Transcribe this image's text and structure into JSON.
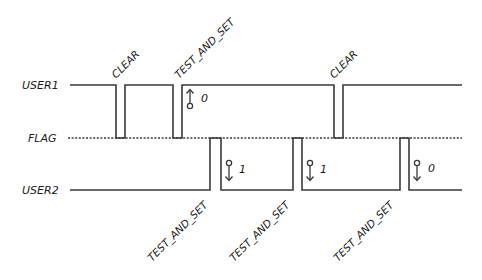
{
  "signals": {
    "user1": {
      "label": "USER1"
    },
    "flag": {
      "label": "FLAG"
    },
    "user2": {
      "label": "USER2"
    }
  },
  "events": {
    "top": [
      {
        "label": "CLEAR"
      },
      {
        "label": "TEST_AND_SET"
      },
      {
        "label": "CLEAR"
      }
    ],
    "bottom": [
      {
        "label": "TEST_AND_SET"
      },
      {
        "label": "TEST_AND_SET"
      },
      {
        "label": "TEST_AND_SET"
      }
    ]
  },
  "annotations": [
    {
      "direction": "up",
      "value": "0",
      "signal": "USER1"
    },
    {
      "direction": "down",
      "value": "1",
      "signal": "USER2"
    },
    {
      "direction": "down",
      "value": "1",
      "signal": "USER2"
    },
    {
      "direction": "down",
      "value": "0",
      "signal": "USER2"
    }
  ],
  "colors": {
    "line": "#3a3a3a",
    "text": "#1a1a1a",
    "background": "#ffffff"
  }
}
